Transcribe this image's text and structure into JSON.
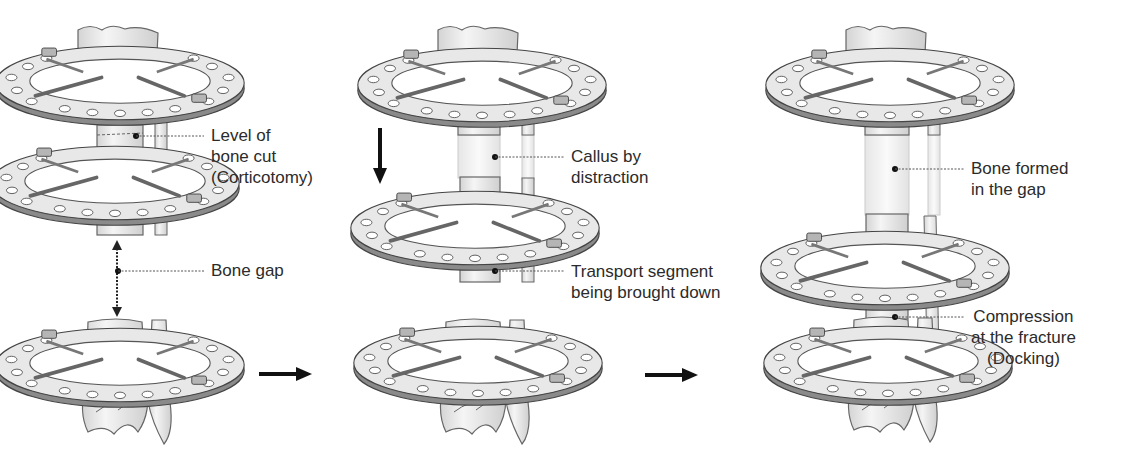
{
  "diagram": {
    "stages": [
      {
        "id": "stage-1",
        "labels": [
          {
            "name": "level-of-bone-cut",
            "lines": [
              "Level of",
              "bone cut",
              "(Corticotomy)"
            ]
          },
          {
            "name": "bone-gap",
            "lines": [
              "Bone gap"
            ]
          }
        ]
      },
      {
        "id": "stage-2",
        "labels": [
          {
            "name": "callus-by-distraction",
            "lines": [
              "Callus by",
              "distraction"
            ]
          },
          {
            "name": "transport-segment",
            "lines": [
              "Transport segment",
              "being brought down"
            ]
          }
        ]
      },
      {
        "id": "stage-3",
        "labels": [
          {
            "name": "bone-formed",
            "lines": [
              "Bone formed",
              "in the gap"
            ]
          },
          {
            "name": "compression-docking",
            "lines": [
              "Compression",
              "at the fracture",
              "(Docking)"
            ]
          }
        ]
      }
    ],
    "arrows": [
      {
        "name": "stage-1-to-2-arrow",
        "direction": "right"
      },
      {
        "name": "stage-2-to-3-arrow",
        "direction": "right"
      },
      {
        "name": "transport-direction-arrow",
        "direction": "down"
      }
    ],
    "colors": {
      "bone": "#ededed",
      "ring": "#e6e6e6",
      "ring_edge": "#555555",
      "regenerate": "#f4f4f4",
      "text": "#2b2b2b"
    }
  }
}
